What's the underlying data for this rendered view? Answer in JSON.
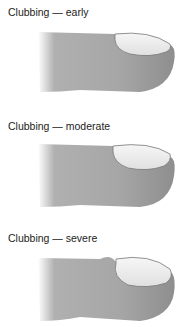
{
  "panels": [
    {
      "label": "Clubbing — early",
      "stage": "early"
    },
    {
      "label": "Clubbing — moderate",
      "stage": "moderate"
    },
    {
      "label": "Clubbing — severe",
      "stage": "severe"
    }
  ],
  "colors": {
    "skin": "#9a9a9a",
    "skin_light": "#c8c8c8",
    "nail": "#f2f2f2",
    "nail_edge": "#8a8a8a"
  }
}
